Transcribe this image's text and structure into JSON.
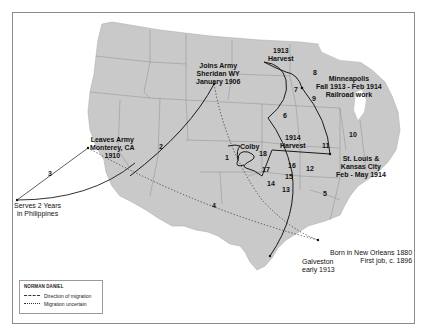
{
  "map": {
    "subject": "Migration route of Norman Daniel",
    "colors": {
      "land": "#c9c9c9",
      "state_borders": "#8e8e8e",
      "route": "#1a1a1a",
      "frame": "#8a8a8a"
    },
    "places": [
      {
        "id": "joins-army",
        "lines": [
          "Joins Army",
          "Sheridan WY",
          "January 1906"
        ]
      },
      {
        "id": "leaves-army",
        "lines": [
          "Leaves Army",
          "Monterey, CA",
          "1910"
        ]
      },
      {
        "id": "philippines",
        "lines": [
          "Serves 2 Years",
          "in Philippines"
        ]
      },
      {
        "id": "harvest-1913",
        "lines": [
          "1913",
          "Harvest"
        ]
      },
      {
        "id": "minneapolis",
        "lines": [
          "Minneapolis",
          "Fall 1913 - Feb 1914",
          "Railroad work"
        ]
      },
      {
        "id": "st-louis",
        "lines": [
          "St. Louis &",
          "Kansas City",
          "Feb - May 1914"
        ]
      },
      {
        "id": "harvest-1914",
        "lines": [
          "1914",
          "Harvest"
        ]
      },
      {
        "id": "colby",
        "lines": [
          "Colby"
        ]
      },
      {
        "id": "new-orleans",
        "lines": [
          "Born in New Orleans 1880",
          "First job, c. 1896"
        ]
      },
      {
        "id": "galveston",
        "lines": [
          "Galveston",
          "early 1913"
        ]
      }
    ],
    "route_segments": [
      "1",
      "2",
      "3",
      "4",
      "5",
      "6",
      "7",
      "8",
      "9",
      "10",
      "11",
      "12",
      "13",
      "14",
      "15",
      "16",
      "17",
      "18"
    ]
  },
  "legend": {
    "title": "NORMAN DANIEL",
    "items": [
      {
        "style": "solid",
        "label": "Direction of migration"
      },
      {
        "style": "dotted",
        "label": "Migration uncertain"
      }
    ]
  }
}
